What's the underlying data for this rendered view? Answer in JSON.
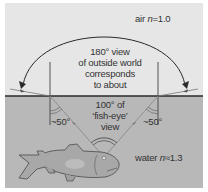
{
  "diagram": {
    "type": "refraction-snells-window",
    "colors": {
      "air": "#e6e6e6",
      "water": "#b8b8b8",
      "surface_line": "#2a2a2a",
      "ray": "#8a8a8a",
      "text": "#333333",
      "fish_fill": "#a8a8a8",
      "fish_outline": "#555555"
    },
    "media": {
      "air": {
        "name": "air",
        "symbol": "n",
        "value": "=1.0"
      },
      "water": {
        "name": "water",
        "symbol": "n",
        "value": "≈1.3"
      }
    },
    "labels": {
      "outside_view": [
        "180° view",
        "of outside world",
        "corresponds",
        "to about"
      ],
      "fisheye_view": [
        "100° of",
        "‘fish-eye’",
        "view"
      ],
      "angle_left": "~50°",
      "angle_right": "~50°"
    }
  }
}
